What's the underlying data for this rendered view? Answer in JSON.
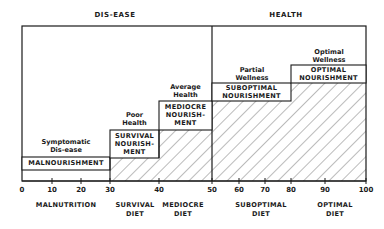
{
  "headers": {
    "left": "DIS-EASE",
    "right": "HEALTH"
  },
  "stages": [
    {
      "health_label_1": "Symptomatic",
      "health_label_2": "Dis-ease",
      "nourishment_1": "MALNOURISHMENT",
      "nourishment_2": "",
      "nourishment_3": "",
      "x_start": 0,
      "x_end": 30
    },
    {
      "health_label_1": "Poor",
      "health_label_2": "Health",
      "nourishment_1": "SURVIVAL",
      "nourishment_2": "NOURISH-",
      "nourishment_3": "MENT",
      "x_start": 30,
      "x_end": 40
    },
    {
      "health_label_1": "Average",
      "health_label_2": "Health",
      "nourishment_1": "MEDIOCRE",
      "nourishment_2": "NOURISH-",
      "nourishment_3": "MENT",
      "x_start": 40,
      "x_end": 50
    },
    {
      "health_label_1": "Partial",
      "health_label_2": "Wellness",
      "nourishment_1": "SUBOPTIMAL",
      "nourishment_2": "NOURISHMENT",
      "nourishment_3": "",
      "x_start": 50,
      "x_end": 80
    },
    {
      "health_label_1": "Optimal",
      "health_label_2": "Wellness",
      "nourishment_1": "OPTIMAL",
      "nourishment_2": "NOURISHMENT",
      "nourishment_3": "",
      "x_start": 80,
      "x_end": 100
    }
  ],
  "axis": {
    "ticks": [
      "0",
      "10",
      "20",
      "30",
      "40",
      "50",
      "60",
      "70",
      "80",
      "90",
      "100"
    ]
  },
  "diets": [
    {
      "line1": "MALNUTRITION",
      "line2": ""
    },
    {
      "line1": "SURVIVAL",
      "line2": "DIET"
    },
    {
      "line1": "MEDIOCRE",
      "line2": "DIET"
    },
    {
      "line1": "SUBOPTIMAL",
      "line2": "DIET"
    },
    {
      "line1": "OPTIMAL",
      "line2": "DIET"
    }
  ],
  "colors": {
    "line": "#1a1a1a",
    "hatch": "#555555",
    "background": "#ffffff"
  }
}
